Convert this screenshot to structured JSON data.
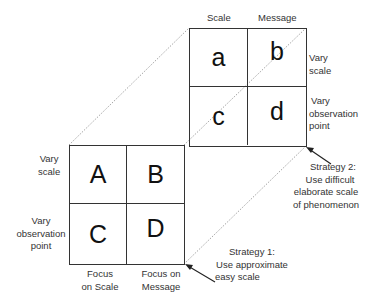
{
  "small_grid": {
    "col_headers": [
      "Scale",
      "Message"
    ],
    "row_labels": [
      [
        "Vary",
        "scale"
      ],
      [
        "Vary",
        "observation",
        "point"
      ]
    ],
    "cells": [
      "a",
      "b",
      "c",
      "d"
    ]
  },
  "large_grid": {
    "col_headers": [
      [
        "Focus",
        "on Scale"
      ],
      [
        "Focus on",
        "Message"
      ]
    ],
    "row_labels": [
      [
        "Vary",
        "scale"
      ],
      [
        "Vary",
        "observation",
        "point"
      ]
    ],
    "cells": [
      "A",
      "B",
      "C",
      "D"
    ]
  },
  "strategies": [
    {
      "lines": [
        "Strategy 1:",
        "Use approximate",
        "easy scale"
      ]
    },
    {
      "lines": [
        "Strategy 2:",
        "Use difficult",
        "elaborate scale",
        "of phenomenon"
      ]
    }
  ],
  "colors": {
    "border": "#333333",
    "dotted": "#888888",
    "text": "#333333"
  }
}
